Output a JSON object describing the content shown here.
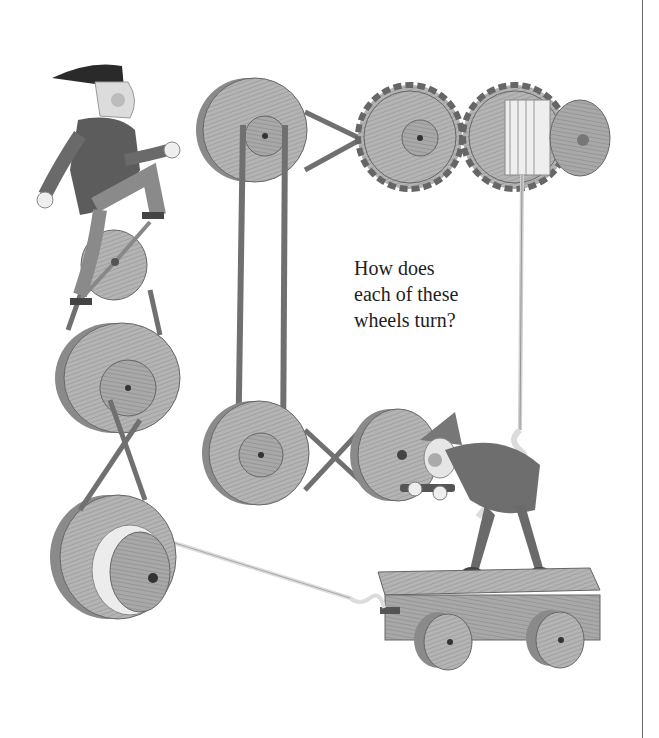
{
  "page": {
    "question_lines": [
      "How does",
      "each of these",
      "wheels turn?"
    ]
  },
  "illustration": {
    "elements": [
      "gnome-on-unicycle-pedal",
      "pedal-wheel",
      "crossed-belt-pulleys-left",
      "large-pulley-with-rope-spool",
      "top-left-pulley",
      "vertical-belt",
      "crossed-belt-to-gear",
      "left-gear",
      "right-gear-with-rope-spool",
      "bottom-middle-pulleys-crossed-belt",
      "gnome-cranking-wheel",
      "rope-knot",
      "wagon-cart",
      "cart-wheels"
    ],
    "colors": {
      "wood": "#a9a9a9",
      "wood_dark": "#7d7d7d",
      "belt": "#6f6f6f",
      "rope": "#f2f2f2",
      "ink": "#4a4a4a"
    }
  }
}
